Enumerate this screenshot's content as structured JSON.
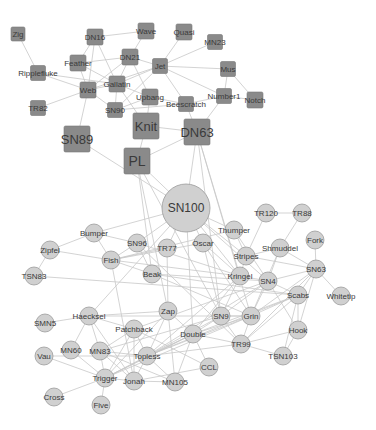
{
  "colors": {
    "background": "#ffffff",
    "edge": "#c8c8c8",
    "square_fill": "#8a8a8a",
    "circle_fill": "#d0d0d0",
    "label": "#3a3a3a"
  },
  "groups": [
    {
      "id": "A",
      "shape": "square"
    },
    {
      "id": "B",
      "shape": "circle"
    }
  ],
  "nodes": [
    {
      "id": "Zig",
      "x": 18,
      "y": 34,
      "s": 14,
      "shape": "square",
      "fs": 8
    },
    {
      "id": "DN16",
      "x": 95,
      "y": 37,
      "s": 16,
      "shape": "square",
      "fs": 8
    },
    {
      "id": "Wave",
      "x": 146,
      "y": 31,
      "s": 16,
      "shape": "square",
      "fs": 8
    },
    {
      "id": "Quasi",
      "x": 184,
      "y": 32,
      "s": 16,
      "shape": "square",
      "fs": 8
    },
    {
      "id": "MN23",
      "x": 215,
      "y": 42,
      "s": 15,
      "shape": "square",
      "fs": 8
    },
    {
      "id": "Feather",
      "x": 78,
      "y": 63,
      "s": 16,
      "shape": "square",
      "fs": 8
    },
    {
      "id": "DN21",
      "x": 130,
      "y": 57,
      "s": 16,
      "shape": "square",
      "fs": 8
    },
    {
      "id": "Jet",
      "x": 160,
      "y": 66,
      "s": 15,
      "shape": "square",
      "fs": 8
    },
    {
      "id": "Mus",
      "x": 228,
      "y": 69,
      "s": 15,
      "shape": "square",
      "fs": 8
    },
    {
      "id": "Ripplefluke",
      "x": 38,
      "y": 73,
      "s": 15,
      "shape": "square",
      "fs": 8
    },
    {
      "id": "Gallatin",
      "x": 117,
      "y": 84,
      "s": 16,
      "shape": "square",
      "fs": 8
    },
    {
      "id": "Web",
      "x": 88,
      "y": 90,
      "s": 16,
      "shape": "square",
      "fs": 8
    },
    {
      "id": "Number1",
      "x": 224,
      "y": 96,
      "s": 15,
      "shape": "square",
      "fs": 8
    },
    {
      "id": "Upbang",
      "x": 150,
      "y": 97,
      "s": 16,
      "shape": "square",
      "fs": 8
    },
    {
      "id": "Notch",
      "x": 255,
      "y": 100,
      "s": 16,
      "shape": "square",
      "fs": 8
    },
    {
      "id": "Beescratch",
      "x": 186,
      "y": 104,
      "s": 15,
      "shape": "square",
      "fs": 8
    },
    {
      "id": "TR82",
      "x": 38,
      "y": 108,
      "s": 15,
      "shape": "square",
      "fs": 8
    },
    {
      "id": "SN90",
      "x": 115,
      "y": 110,
      "s": 15,
      "shape": "square",
      "fs": 8
    },
    {
      "id": "Knit",
      "x": 146,
      "y": 126,
      "s": 26,
      "shape": "square",
      "fs": 13
    },
    {
      "id": "SN89",
      "x": 77,
      "y": 139,
      "s": 26,
      "shape": "square",
      "fs": 13
    },
    {
      "id": "DN63",
      "x": 197,
      "y": 132,
      "s": 26,
      "shape": "square",
      "fs": 13
    },
    {
      "id": "PL",
      "x": 137,
      "y": 161,
      "s": 26,
      "shape": "square",
      "fs": 14
    },
    {
      "id": "SN100",
      "x": 186,
      "y": 208,
      "s": 24,
      "shape": "circle",
      "fs": 12
    },
    {
      "id": "TR120",
      "x": 266,
      "y": 213,
      "s": 9,
      "shape": "circle",
      "fs": 8
    },
    {
      "id": "TR88",
      "x": 302,
      "y": 213,
      "s": 9,
      "shape": "circle",
      "fs": 8
    },
    {
      "id": "Thumper",
      "x": 234,
      "y": 230,
      "s": 9,
      "shape": "circle",
      "fs": 8
    },
    {
      "id": "Bumper",
      "x": 94,
      "y": 233,
      "s": 9,
      "shape": "circle",
      "fs": 8
    },
    {
      "id": "Fork",
      "x": 315,
      "y": 240,
      "s": 9,
      "shape": "circle",
      "fs": 8
    },
    {
      "id": "Oscar",
      "x": 203,
      "y": 243,
      "s": 9,
      "shape": "circle",
      "fs": 8
    },
    {
      "id": "SN96",
      "x": 137,
      "y": 243,
      "s": 9,
      "shape": "circle",
      "fs": 8
    },
    {
      "id": "TR77",
      "x": 167,
      "y": 248,
      "s": 9,
      "shape": "circle",
      "fs": 8
    },
    {
      "id": "Shmuddel",
      "x": 280,
      "y": 248,
      "s": 9,
      "shape": "circle",
      "fs": 8
    },
    {
      "id": "Zipfel",
      "x": 50,
      "y": 250,
      "s": 9,
      "shape": "circle",
      "fs": 8
    },
    {
      "id": "Stripes",
      "x": 246,
      "y": 256,
      "s": 9,
      "shape": "circle",
      "fs": 8
    },
    {
      "id": "Fish",
      "x": 111,
      "y": 260,
      "s": 9,
      "shape": "circle",
      "fs": 8
    },
    {
      "id": "SN63",
      "x": 316,
      "y": 269,
      "s": 9,
      "shape": "circle",
      "fs": 8
    },
    {
      "id": "Beak",
      "x": 152,
      "y": 274,
      "s": 9,
      "shape": "circle",
      "fs": 8
    },
    {
      "id": "TSN83",
      "x": 34,
      "y": 276,
      "s": 9,
      "shape": "circle",
      "fs": 8
    },
    {
      "id": "Kringel",
      "x": 240,
      "y": 276,
      "s": 9,
      "shape": "circle",
      "fs": 8
    },
    {
      "id": "SN4",
      "x": 268,
      "y": 281,
      "s": 9,
      "shape": "circle",
      "fs": 8
    },
    {
      "id": "Scabs",
      "x": 298,
      "y": 295,
      "s": 9,
      "shape": "circle",
      "fs": 8
    },
    {
      "id": "Whitetip",
      "x": 341,
      "y": 296,
      "s": 9,
      "shape": "circle",
      "fs": 8
    },
    {
      "id": "Zap",
      "x": 168,
      "y": 311,
      "s": 9,
      "shape": "circle",
      "fs": 8
    },
    {
      "id": "Haecksel",
      "x": 89,
      "y": 316,
      "s": 9,
      "shape": "circle",
      "fs": 8
    },
    {
      "id": "SN9",
      "x": 221,
      "y": 316,
      "s": 9,
      "shape": "circle",
      "fs": 8
    },
    {
      "id": "Grin",
      "x": 251,
      "y": 316,
      "s": 9,
      "shape": "circle",
      "fs": 8
    },
    {
      "id": "SMN5",
      "x": 45,
      "y": 323,
      "s": 9,
      "shape": "circle",
      "fs": 8
    },
    {
      "id": "Patchback",
      "x": 134,
      "y": 329,
      "s": 9,
      "shape": "circle",
      "fs": 8
    },
    {
      "id": "Double",
      "x": 193,
      "y": 334,
      "s": 9,
      "shape": "circle",
      "fs": 8
    },
    {
      "id": "Hook",
      "x": 298,
      "y": 330,
      "s": 9,
      "shape": "circle",
      "fs": 8
    },
    {
      "id": "MN60",
      "x": 71,
      "y": 350,
      "s": 9,
      "shape": "circle",
      "fs": 8
    },
    {
      "id": "MN83",
      "x": 100,
      "y": 351,
      "s": 9,
      "shape": "circle",
      "fs": 8
    },
    {
      "id": "TR99",
      "x": 241,
      "y": 344,
      "s": 9,
      "shape": "circle",
      "fs": 8
    },
    {
      "id": "Topless",
      "x": 147,
      "y": 356,
      "s": 9,
      "shape": "circle",
      "fs": 8
    },
    {
      "id": "TSN103",
      "x": 283,
      "y": 356,
      "s": 9,
      "shape": "circle",
      "fs": 8
    },
    {
      "id": "Vau",
      "x": 44,
      "y": 356,
      "s": 9,
      "shape": "circle",
      "fs": 8
    },
    {
      "id": "CCL",
      "x": 209,
      "y": 367,
      "s": 9,
      "shape": "circle",
      "fs": 8
    },
    {
      "id": "Trigger",
      "x": 105,
      "y": 378,
      "s": 9,
      "shape": "circle",
      "fs": 8
    },
    {
      "id": "Jonah",
      "x": 134,
      "y": 381,
      "s": 9,
      "shape": "circle",
      "fs": 8
    },
    {
      "id": "MN105",
      "x": 175,
      "y": 382,
      "s": 9,
      "shape": "circle",
      "fs": 8
    },
    {
      "id": "Cross",
      "x": 54,
      "y": 397,
      "s": 9,
      "shape": "circle",
      "fs": 8
    },
    {
      "id": "Five",
      "x": 101,
      "y": 405,
      "s": 9,
      "shape": "circle",
      "fs": 8
    }
  ],
  "edges": [
    [
      "Zig",
      "Ripplefluke"
    ],
    [
      "DN16",
      "Wave"
    ],
    [
      "DN16",
      "Feather"
    ],
    [
      "DN16",
      "Web"
    ],
    [
      "DN16",
      "Gallatin"
    ],
    [
      "Wave",
      "DN21"
    ],
    [
      "Quasi",
      "Jet"
    ],
    [
      "MN23",
      "Jet"
    ],
    [
      "Feather",
      "Gallatin"
    ],
    [
      "Feather",
      "Web"
    ],
    [
      "Feather",
      "DN21"
    ],
    [
      "Ripplefluke",
      "Web"
    ],
    [
      "Ripplefluke",
      "Gallatin"
    ],
    [
      "DN21",
      "Jet"
    ],
    [
      "DN21",
      "Gallatin"
    ],
    [
      "DN21",
      "Web"
    ],
    [
      "DN21",
      "Upbang"
    ],
    [
      "Jet",
      "Mus"
    ],
    [
      "Jet",
      "Gallatin"
    ],
    [
      "Jet",
      "Web"
    ],
    [
      "Jet",
      "Beescratch"
    ],
    [
      "Jet",
      "Number1"
    ],
    [
      "Jet",
      "SN90"
    ],
    [
      "Mus",
      "Number1"
    ],
    [
      "Mus",
      "Notch"
    ],
    [
      "Number1",
      "Notch"
    ],
    [
      "Number1",
      "Beescratch"
    ],
    [
      "Number1",
      "DN63"
    ],
    [
      "Gallatin",
      "Web"
    ],
    [
      "Gallatin",
      "SN90"
    ],
    [
      "Gallatin",
      "Upbang"
    ],
    [
      "Gallatin",
      "Knit"
    ],
    [
      "Web",
      "TR82"
    ],
    [
      "Web",
      "SN90"
    ],
    [
      "Web",
      "SN89"
    ],
    [
      "Upbang",
      "Knit"
    ],
    [
      "Upbang",
      "Beescratch"
    ],
    [
      "Upbang",
      "SN90"
    ],
    [
      "Beescratch",
      "DN63"
    ],
    [
      "Beescratch",
      "SN90"
    ],
    [
      "Knit",
      "DN63"
    ],
    [
      "Knit",
      "PL"
    ],
    [
      "SN89",
      "SN100"
    ],
    [
      "DN63",
      "PL"
    ],
    [
      "PL",
      "SN100"
    ],
    [
      "PL",
      "Beak"
    ],
    [
      "PL",
      "Zap"
    ],
    [
      "PL",
      "SN9"
    ],
    [
      "DN63",
      "SN9"
    ],
    [
      "DN63",
      "Kringel"
    ],
    [
      "DN63",
      "Grin"
    ],
    [
      "DN63",
      "SN100"
    ],
    [
      "SN100",
      "Bumper"
    ],
    [
      "SN100",
      "SN96"
    ],
    [
      "SN100",
      "TR77"
    ],
    [
      "SN100",
      "Oscar"
    ],
    [
      "SN100",
      "Thumper"
    ],
    [
      "SN100",
      "Stripes"
    ],
    [
      "SN100",
      "Kringel"
    ],
    [
      "SN100",
      "SN4"
    ],
    [
      "SN100",
      "Haecksel"
    ],
    [
      "SN100",
      "Double"
    ],
    [
      "TR120",
      "TR88"
    ],
    [
      "TR120",
      "Stripes"
    ],
    [
      "TR88",
      "Shmuddel"
    ],
    [
      "Thumper",
      "Stripes"
    ],
    [
      "Thumper",
      "Fish"
    ],
    [
      "Thumper",
      "SN4"
    ],
    [
      "Bumper",
      "Zipfel"
    ],
    [
      "Bumper",
      "Fish"
    ],
    [
      "Bumper",
      "SN96"
    ],
    [
      "Zipfel",
      "TSN83"
    ],
    [
      "Zipfel",
      "Fish"
    ],
    [
      "Fork",
      "SN63"
    ],
    [
      "Oscar",
      "Fish"
    ],
    [
      "Oscar",
      "SN9"
    ],
    [
      "Oscar",
      "Kringel"
    ],
    [
      "Oscar",
      "Grin"
    ],
    [
      "SN96",
      "Fish"
    ],
    [
      "SN96",
      "Beak"
    ],
    [
      "SN96",
      "Kringel"
    ],
    [
      "SN96",
      "TR99"
    ],
    [
      "TR77",
      "Fish"
    ],
    [
      "TR77",
      "Zap"
    ],
    [
      "Shmuddel",
      "SN4"
    ],
    [
      "Shmuddel",
      "SN63"
    ],
    [
      "Shmuddel",
      "Stripes"
    ],
    [
      "Shmuddel",
      "Grin"
    ],
    [
      "Stripes",
      "SN63"
    ],
    [
      "Stripes",
      "Kringel"
    ],
    [
      "Fish",
      "Beak"
    ],
    [
      "Fish",
      "Jonah"
    ],
    [
      "Fish",
      "Kringel"
    ],
    [
      "SN63",
      "Whitetip"
    ],
    [
      "SN63",
      "Scabs"
    ],
    [
      "SN63",
      "SN4"
    ],
    [
      "SN63",
      "Hook"
    ],
    [
      "SN63",
      "Grin"
    ],
    [
      "SN63",
      "TR99"
    ],
    [
      "Beak",
      "SN4"
    ],
    [
      "Beak",
      "Grin"
    ],
    [
      "Beak",
      "Scabs"
    ],
    [
      "TSN83",
      "Scabs"
    ],
    [
      "Kringel",
      "SN4"
    ],
    [
      "Kringel",
      "SN9"
    ],
    [
      "Kringel",
      "Double"
    ],
    [
      "Kringel",
      "Topless"
    ],
    [
      "SN4",
      "Scabs"
    ],
    [
      "SN4",
      "SN9"
    ],
    [
      "SN4",
      "Grin"
    ],
    [
      "SN4",
      "Hook"
    ],
    [
      "SN4",
      "Topless"
    ],
    [
      "SN4",
      "Patchback"
    ],
    [
      "Scabs",
      "Hook"
    ],
    [
      "Scabs",
      "Grin"
    ],
    [
      "Scabs",
      "TR99"
    ],
    [
      "Scabs",
      "TSN103"
    ],
    [
      "Scabs",
      "Double"
    ],
    [
      "Scabs",
      "Topless"
    ],
    [
      "Zap",
      "Haecksel"
    ],
    [
      "Zap",
      "Double"
    ],
    [
      "Zap",
      "Topless"
    ],
    [
      "Zap",
      "MN105"
    ],
    [
      "Zap",
      "Trigger"
    ],
    [
      "Haecksel",
      "SMN5"
    ],
    [
      "Haecksel",
      "Patchback"
    ],
    [
      "Haecksel",
      "MN60"
    ],
    [
      "Haecksel",
      "MN83"
    ],
    [
      "Haecksel",
      "Jonah"
    ],
    [
      "Haecksel",
      "Grin"
    ],
    [
      "SN9",
      "Grin"
    ],
    [
      "SN9",
      "Double"
    ],
    [
      "SN9",
      "Topless"
    ],
    [
      "SN9",
      "TR99"
    ],
    [
      "SN9",
      "MN83"
    ],
    [
      "Grin",
      "TR99"
    ],
    [
      "Grin",
      "Topless"
    ],
    [
      "Grin",
      "Trigger"
    ],
    [
      "Grin",
      "Double"
    ],
    [
      "Patchback",
      "MN83"
    ],
    [
      "Patchback",
      "Topless"
    ],
    [
      "Patchback",
      "Trigger"
    ],
    [
      "Patchback",
      "Jonah"
    ],
    [
      "Patchback",
      "CCL"
    ],
    [
      "Double",
      "Topless"
    ],
    [
      "Double",
      "CCL"
    ],
    [
      "Double",
      "TR99"
    ],
    [
      "Double",
      "Trigger"
    ],
    [
      "Hook",
      "TR99"
    ],
    [
      "Hook",
      "TSN103"
    ],
    [
      "MN83",
      "Topless"
    ],
    [
      "MN83",
      "Trigger"
    ],
    [
      "MN83",
      "Jonah"
    ],
    [
      "MN83",
      "MN105"
    ],
    [
      "TR99",
      "Topless"
    ],
    [
      "TR99",
      "TSN103"
    ],
    [
      "Topless",
      "Trigger"
    ],
    [
      "Topless",
      "Jonah"
    ],
    [
      "Topless",
      "MN105"
    ],
    [
      "Vau",
      "Trigger"
    ],
    [
      "Vau",
      "Topless"
    ],
    [
      "MN60",
      "Trigger"
    ],
    [
      "Trigger",
      "Jonah"
    ],
    [
      "Trigger",
      "Cross"
    ],
    [
      "Trigger",
      "Five"
    ],
    [
      "Trigger",
      "Double"
    ],
    [
      "Jonah",
      "MN105"
    ],
    [
      "Jonah",
      "CCL"
    ],
    [
      "MN105",
      "Double"
    ]
  ]
}
